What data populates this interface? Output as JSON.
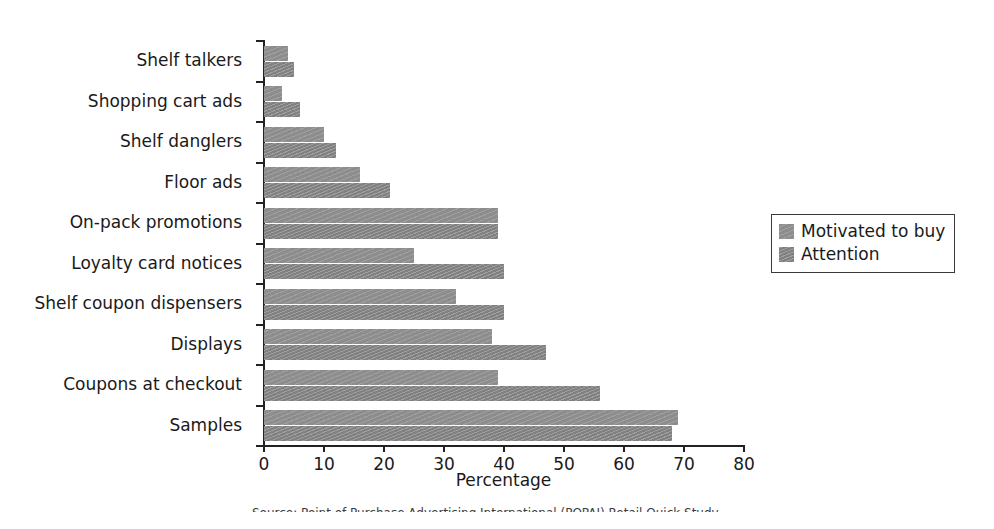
{
  "chart_data": {
    "type": "bar",
    "orientation": "horizontal",
    "title": "",
    "xlabel": "Percentage",
    "ylabel": "",
    "xlim": [
      0,
      80
    ],
    "xticks": [
      0,
      10,
      20,
      30,
      40,
      50,
      60,
      70,
      80
    ],
    "grid": false,
    "legend_position": "right",
    "categories": [
      "Shelf talkers",
      "Shopping cart ads",
      "Shelf danglers",
      "Floor ads",
      "On-pack promotions",
      "Loyalty card notices",
      "Shelf coupon dispensers",
      "Displays",
      "Coupons at checkout",
      "Samples"
    ],
    "series": [
      {
        "name": "Motivated to buy",
        "color": "#8d8d8d",
        "values": [
          4,
          3,
          10,
          16,
          39,
          25,
          32,
          38,
          39,
          69
        ]
      },
      {
        "name": "Attention",
        "color": "#878787",
        "values": [
          5,
          6,
          12,
          21,
          39,
          40,
          40,
          47,
          56,
          68
        ]
      }
    ]
  },
  "axis": {
    "x_title": "Percentage",
    "tick_labels": [
      "0",
      "10",
      "20",
      "30",
      "40",
      "50",
      "60",
      "70",
      "80"
    ]
  },
  "legend": {
    "entries": [
      {
        "label": "Motivated to buy"
      },
      {
        "label": "Attention"
      }
    ]
  },
  "caption": {
    "text": "Source: Point of Purchase Advertising International (POPAI) Retail Quick Study"
  }
}
